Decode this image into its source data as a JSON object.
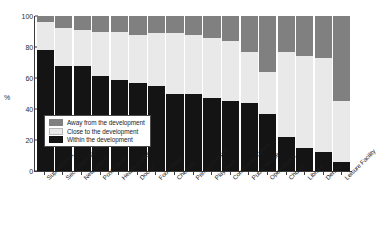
{
  "chart_data": {
    "type": "bar",
    "subtype": "stacked-percentage",
    "title": "",
    "xlabel": "",
    "ylabel": "%",
    "ylim": [
      0,
      100
    ],
    "yticks": [
      0,
      20,
      40,
      60,
      80,
      100
    ],
    "grid": false,
    "legend_position": "inside-lower-left",
    "categories": [
      "Supermarket",
      "Secondary School",
      "Newsagent",
      "Post Office",
      "Health Centre",
      "Doctor",
      "Food Shop",
      "Chemist",
      "Primary School",
      "Play Area",
      "Community Centre",
      "Public House",
      "Open Space",
      "Church",
      "Library",
      "Dentist",
      "Leisure Facility"
    ],
    "series": [
      {
        "name": "Within the development",
        "color": "#141414",
        "values": [
          78,
          68,
          68,
          61,
          59,
          57,
          55,
          50,
          50,
          47,
          45,
          44,
          37,
          22,
          15,
          12,
          6
        ]
      },
      {
        "name": "Close to the development",
        "color": "#e9e9e9",
        "values": [
          18,
          24,
          23,
          29,
          31,
          31,
          34,
          39,
          38,
          39,
          39,
          33,
          27,
          55,
          59,
          61,
          39
        ]
      },
      {
        "name": "Away from the development",
        "color": "#808080",
        "values": [
          4,
          8,
          9,
          10,
          10,
          12,
          11,
          11,
          12,
          14,
          16,
          23,
          36,
          23,
          26,
          27,
          55
        ]
      }
    ]
  },
  "legend": {
    "items": [
      {
        "label": "Away from the development",
        "swatch": "away"
      },
      {
        "label": "Close to the development",
        "swatch": "close"
      },
      {
        "label": "Within the development",
        "swatch": "within"
      }
    ]
  }
}
